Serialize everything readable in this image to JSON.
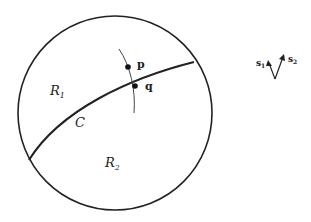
{
  "diagram": {
    "regions": [
      {
        "id": "R1",
        "label": "R",
        "subscript": "1"
      },
      {
        "id": "R2",
        "label": "R",
        "subscript": "2"
      }
    ],
    "curve": {
      "label": "C"
    },
    "points": [
      {
        "id": "p",
        "label": "p"
      },
      {
        "id": "q",
        "label": "q"
      }
    ],
    "vectors": [
      {
        "id": "s1",
        "label": "s",
        "subscript": "1"
      },
      {
        "id": "s2",
        "label": "s",
        "subscript": "2"
      }
    ],
    "colors": {
      "stroke": "#222222",
      "background": "#ffffff"
    }
  }
}
